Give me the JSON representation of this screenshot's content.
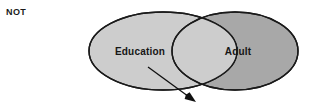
{
  "diagram": {
    "type": "venn",
    "operator_label": "NOT",
    "sets": [
      {
        "id": "education",
        "label": "Education",
        "fill": "#cdcdcd",
        "stroke": "#1a1a1a",
        "cx": 163,
        "cy": 51,
        "rx": 74,
        "ry": 39
      },
      {
        "id": "adult",
        "label": "Adult",
        "fill": "#a8a8a8",
        "stroke": "#1a1a1a",
        "cx": 235,
        "cy": 51,
        "rx": 63,
        "ry": 39
      }
    ],
    "intersection": {
      "fill": "#cdcdcd",
      "stroke": "#1a1a1a",
      "description": "overlap-region"
    },
    "annotation_arrow": {
      "name": "pointer-arrow",
      "color": "#101010",
      "from_x": 148,
      "from_y": 67,
      "to_x": 196,
      "to_y": 102
    },
    "background": "#ffffff"
  }
}
